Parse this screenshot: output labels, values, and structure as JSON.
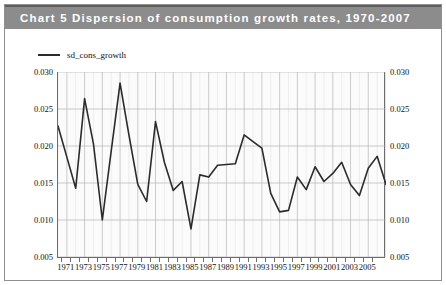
{
  "title": {
    "prefix": "Chart 5",
    "text": "Chart 5  Dispersion of consumption growth rates, 1970-2007",
    "band_color": "#8c8c8c",
    "text_color": "#ffffff"
  },
  "legend": {
    "position": "top-left",
    "entries": [
      {
        "label": "sd_cons_growth",
        "color": "#2b2b2b",
        "marker": "line"
      }
    ]
  },
  "axes": {
    "y_ticks_left": [
      "0.030",
      "0.025",
      "0.020",
      "0.015",
      "0.010",
      "0.005"
    ],
    "y_ticks_right": [
      "0.030",
      "0.025",
      "0.020",
      "0.015",
      "0.010",
      "0.005"
    ],
    "x_ticks": [
      "1971",
      "1973",
      "1975",
      "1977",
      "1979",
      "1981",
      "1983",
      "1985",
      "1987",
      "1989",
      "1991",
      "1993",
      "1995",
      "1997",
      "1999",
      "2001",
      "2003",
      "2005"
    ]
  },
  "chart_data": {
    "type": "line",
    "title": "Chart 5  Dispersion of consumption growth rates, 1970-2007",
    "xlabel": "",
    "ylabel": "",
    "xlim": [
      1970,
      2007
    ],
    "ylim": [
      0.005,
      0.03
    ],
    "grid": true,
    "legend_position": "top-left",
    "series": [
      {
        "name": "sd_cons_growth",
        "color": "#2b2b2b",
        "x": [
          1970,
          1971,
          1972,
          1973,
          1974,
          1975,
          1976,
          1977,
          1978,
          1979,
          1980,
          1981,
          1982,
          1983,
          1984,
          1985,
          1986,
          1987,
          1988,
          1989,
          1990,
          1991,
          1992,
          1993,
          1994,
          1995,
          1996,
          1997,
          1998,
          1999,
          2000,
          2001,
          2002,
          2003,
          2004,
          2005,
          2006,
          2007
        ],
        "values": [
          0.0227,
          0.0185,
          0.0143,
          0.0264,
          0.0203,
          0.01,
          0.0193,
          0.0285,
          0.0215,
          0.0148,
          0.0125,
          0.0233,
          0.0178,
          0.014,
          0.0152,
          0.0088,
          0.0161,
          0.0158,
          0.0174,
          0.0175,
          0.0176,
          0.0215,
          0.0206,
          0.0197,
          0.0136,
          0.0111,
          0.0113,
          0.0158,
          0.0141,
          0.0172,
          0.0152,
          0.0163,
          0.0178,
          0.0148,
          0.0133,
          0.017,
          0.0186,
          0.0148
        ]
      }
    ]
  }
}
